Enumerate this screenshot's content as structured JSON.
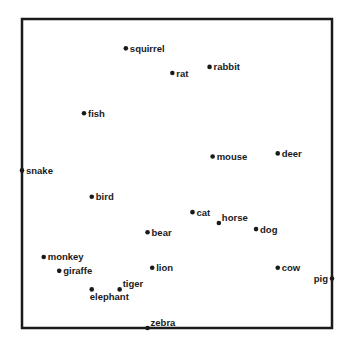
{
  "chart_data": {
    "type": "scatter",
    "title": "",
    "xlabel": "",
    "ylabel": "",
    "xlim": [
      0,
      1
    ],
    "ylim": [
      0,
      1
    ],
    "grid": false,
    "axes_ticks": false,
    "colors": {
      "frame": "#1a1a1a",
      "point": "#1a1a1a",
      "text": "#1a1a1a",
      "background": "#ffffff"
    },
    "points": [
      {
        "label": "squirrel",
        "x": 0.335,
        "y": 0.905,
        "label_side": "right"
      },
      {
        "label": "rat",
        "x": 0.485,
        "y": 0.825,
        "label_side": "right"
      },
      {
        "label": "rabbit",
        "x": 0.605,
        "y": 0.845,
        "label_side": "right"
      },
      {
        "label": "fish",
        "x": 0.2,
        "y": 0.695,
        "label_side": "right"
      },
      {
        "label": "mouse",
        "x": 0.615,
        "y": 0.555,
        "label_side": "right"
      },
      {
        "label": "deer",
        "x": 0.825,
        "y": 0.565,
        "label_side": "right"
      },
      {
        "label": "snake",
        "x": 0.0,
        "y": 0.51,
        "label_side": "right"
      },
      {
        "label": "bird",
        "x": 0.225,
        "y": 0.425,
        "label_side": "right"
      },
      {
        "label": "cat",
        "x": 0.55,
        "y": 0.375,
        "label_side": "right"
      },
      {
        "label": "horse",
        "x": 0.635,
        "y": 0.34,
        "label_side": "right-up"
      },
      {
        "label": "dog",
        "x": 0.755,
        "y": 0.32,
        "label_side": "right"
      },
      {
        "label": "bear",
        "x": 0.405,
        "y": 0.31,
        "label_side": "right"
      },
      {
        "label": "monkey",
        "x": 0.07,
        "y": 0.23,
        "label_side": "right"
      },
      {
        "label": "giraffe",
        "x": 0.12,
        "y": 0.185,
        "label_side": "right"
      },
      {
        "label": "lion",
        "x": 0.42,
        "y": 0.195,
        "label_side": "right"
      },
      {
        "label": "cow",
        "x": 0.825,
        "y": 0.195,
        "label_side": "right"
      },
      {
        "label": "pig",
        "x": 1.0,
        "y": 0.16,
        "label_side": "left"
      },
      {
        "label": "tiger",
        "x": 0.315,
        "y": 0.125,
        "label_side": "right-up"
      },
      {
        "label": "elephant",
        "x": 0.225,
        "y": 0.125,
        "label_side": "below"
      },
      {
        "label": "zebra",
        "x": 0.405,
        "y": 0.0,
        "label_side": "right-up"
      }
    ]
  }
}
